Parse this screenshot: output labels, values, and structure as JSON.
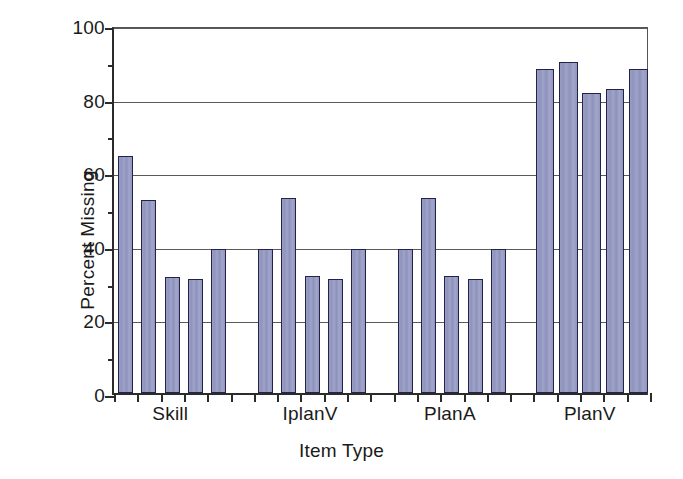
{
  "chart_data": {
    "type": "bar",
    "title": "",
    "xlabel": "Item Type",
    "ylabel": "Percent Missing",
    "ylim": [
      0,
      100
    ],
    "yticks": [
      0,
      20,
      40,
      60,
      80,
      100
    ],
    "ytick_labels": [
      "0",
      "20",
      "40",
      "60",
      "80",
      "100"
    ],
    "yminor_ticks": [
      10,
      30,
      50,
      70,
      90
    ],
    "grid": "horizontal",
    "legend": "none",
    "categories": [
      "Skill",
      "IplanV",
      "PlanA",
      "PlanV"
    ],
    "groups": [
      {
        "name": "Skill",
        "values": [
          64.5,
          52.5,
          31.5,
          31.0,
          39.0
        ]
      },
      {
        "name": "IplanV",
        "values": [
          39.0,
          53.0,
          31.8,
          31.0,
          39.0
        ]
      },
      {
        "name": "PlanA",
        "values": [
          39.0,
          53.0,
          31.8,
          31.0,
          39.0
        ]
      },
      {
        "name": "PlanV",
        "values": [
          88.0,
          90.0,
          81.5,
          82.5,
          88.0
        ]
      }
    ],
    "bar_color": "#9196c0",
    "bar_edge_color": "#23234a",
    "grid_color": "#5a5a5a",
    "axis_color": "#2b2b2b",
    "background": "#ffffff"
  }
}
